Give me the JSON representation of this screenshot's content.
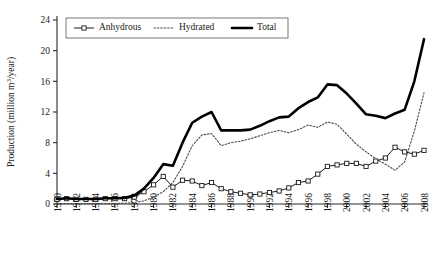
{
  "chart_data": {
    "type": "line",
    "title": "",
    "xlabel": "",
    "ylabel": "Production (million m³/year)",
    "ylabel_parts": {
      "prefix": "Production (million m",
      "sup": "3",
      "suffix": "/year)"
    },
    "xlim": [
      1970,
      2008
    ],
    "ylim": [
      0,
      24
    ],
    "yticks": [
      0,
      4,
      8,
      12,
      16,
      20,
      24
    ],
    "ytick_labels": [
      "0",
      "4",
      "8",
      "12",
      "16",
      "20",
      "24"
    ],
    "xticks": [
      1970,
      1972,
      1974,
      1976,
      1978,
      1980,
      1982,
      1984,
      1986,
      1988,
      1990,
      1992,
      1994,
      1996,
      1998,
      2000,
      2002,
      2004,
      2006,
      2008
    ],
    "xtick_labels": [
      "1970",
      "1972",
      "1974",
      "1976",
      "1978",
      "1980",
      "1982",
      "1984",
      "1986",
      "1988",
      "1990",
      "1992",
      "1994",
      "1996",
      "1998",
      "2000",
      "2002",
      "2004",
      "2006",
      "2008"
    ],
    "grid": false,
    "legend_position": "top-center",
    "x": [
      1970,
      1971,
      1972,
      1973,
      1974,
      1975,
      1976,
      1977,
      1978,
      1979,
      1980,
      1981,
      1982,
      1983,
      1984,
      1985,
      1986,
      1987,
      1988,
      1989,
      1990,
      1991,
      1992,
      1993,
      1994,
      1995,
      1996,
      1997,
      1998,
      1999,
      2000,
      2001,
      2002,
      2003,
      2004,
      2005,
      2006,
      2007,
      2008
    ],
    "series": [
      {
        "name": "Anhydrous",
        "style": "solid-with-square-markers",
        "values": [
          0.6,
          0.7,
          0.6,
          0.6,
          0.6,
          0.7,
          0.7,
          0.7,
          0.9,
          1.6,
          2.5,
          3.6,
          2.2,
          3.1,
          3.0,
          2.4,
          2.8,
          2.0,
          1.6,
          1.4,
          1.2,
          1.3,
          1.5,
          1.7,
          2.1,
          2.8,
          3.0,
          3.9,
          4.9,
          5.1,
          5.3,
          5.3,
          4.9,
          5.6,
          6.0,
          7.4,
          6.8,
          6.5,
          7.0
        ]
      },
      {
        "name": "Hydrated",
        "style": "dotted",
        "values": [
          0.05,
          0.05,
          0.05,
          0.05,
          0.05,
          0.05,
          0.05,
          0.1,
          0.2,
          0.4,
          0.9,
          1.6,
          2.8,
          4.9,
          7.6,
          9.0,
          9.2,
          7.6,
          8.0,
          8.2,
          8.5,
          8.9,
          9.3,
          9.6,
          9.3,
          9.7,
          10.3,
          10.0,
          10.7,
          10.4,
          9.1,
          7.8,
          6.8,
          5.9,
          5.2,
          4.4,
          5.5,
          9.5,
          14.5
        ]
      },
      {
        "name": "Total",
        "style": "thick-solid",
        "values": [
          0.65,
          0.75,
          0.65,
          0.65,
          0.65,
          0.75,
          0.75,
          0.8,
          1.1,
          2.0,
          3.4,
          5.2,
          5.0,
          8.0,
          10.6,
          11.4,
          12.0,
          9.6,
          9.6,
          9.6,
          9.7,
          10.2,
          10.8,
          11.3,
          11.4,
          12.5,
          13.3,
          13.9,
          15.6,
          15.5,
          14.4,
          13.1,
          11.7,
          11.5,
          11.2,
          11.8,
          12.3,
          16.0,
          21.5
        ]
      }
    ],
    "legend": [
      {
        "label": "Anhydrous",
        "style": "solid-with-square-markers"
      },
      {
        "label": "Hydrated",
        "style": "dotted"
      },
      {
        "label": "Total",
        "style": "thick-solid"
      }
    ],
    "colors": {
      "anhydrous": "#1a1a1a",
      "hydrated": "#4a4a4a",
      "total": "#000000",
      "axis": "#2b2b2b",
      "background": "#ffffff"
    }
  }
}
